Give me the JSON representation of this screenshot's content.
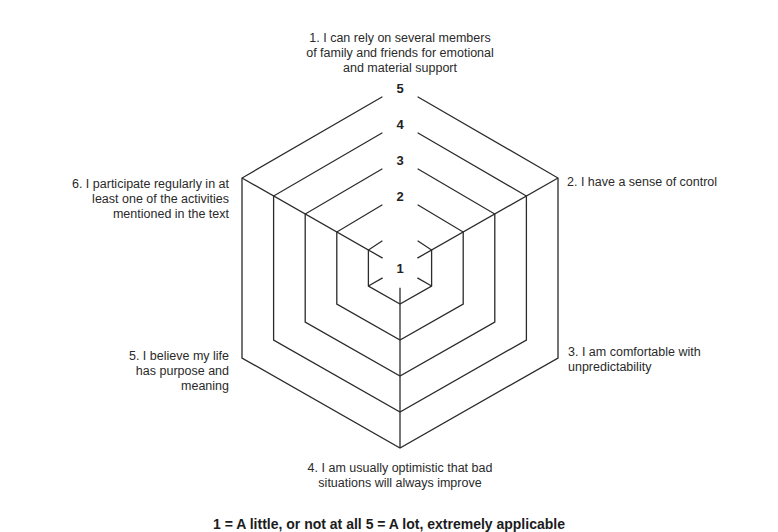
{
  "diagram": {
    "type": "radar-hexagon-worksheet",
    "center": [
      400,
      268
    ],
    "ring_step_y": 36,
    "ring_step_x": 31.6,
    "scale_labels": [
      "1",
      "2",
      "3",
      "4",
      "5"
    ],
    "axes": [
      {
        "id": 1,
        "text_lines": [
          "1. I can rely on several members",
          "of family and friends for emotional",
          "and material support"
        ]
      },
      {
        "id": 2,
        "text_lines": [
          "2. I have a sense of control"
        ]
      },
      {
        "id": 3,
        "text_lines": [
          "3. I am comfortable with",
          "unpredictability"
        ]
      },
      {
        "id": 4,
        "text_lines": [
          "4. I am usually optimistic that bad",
          "situations will always improve"
        ]
      },
      {
        "id": 5,
        "text_lines": [
          "5. I believe my life",
          "has purpose and",
          "meaning"
        ]
      },
      {
        "id": 6,
        "text_lines": [
          "6. I participate regularly in at",
          "least one of the activities",
          "mentioned in the text"
        ]
      }
    ],
    "legend": "1 = A little, or not at all    5 = A lot, extremely applicable",
    "line_color": "#2b2b2b"
  }
}
